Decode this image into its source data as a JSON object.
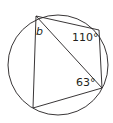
{
  "diagram": {
    "type": "cyclic-quadrilateral-in-circle",
    "circle": {
      "cx": 58,
      "cy": 65,
      "r": 50
    },
    "vertices": {
      "A": {
        "x": 36,
        "y": 16
      },
      "B": {
        "x": 99,
        "y": 30
      },
      "C": {
        "x": 102,
        "y": 88
      },
      "D": {
        "x": 33,
        "y": 108
      }
    },
    "diagonal": [
      "A",
      "C"
    ],
    "labels": {
      "angle_b": "b",
      "angle_110": "110°",
      "angle_63": "63°"
    },
    "stroke_color": "#231f20"
  }
}
